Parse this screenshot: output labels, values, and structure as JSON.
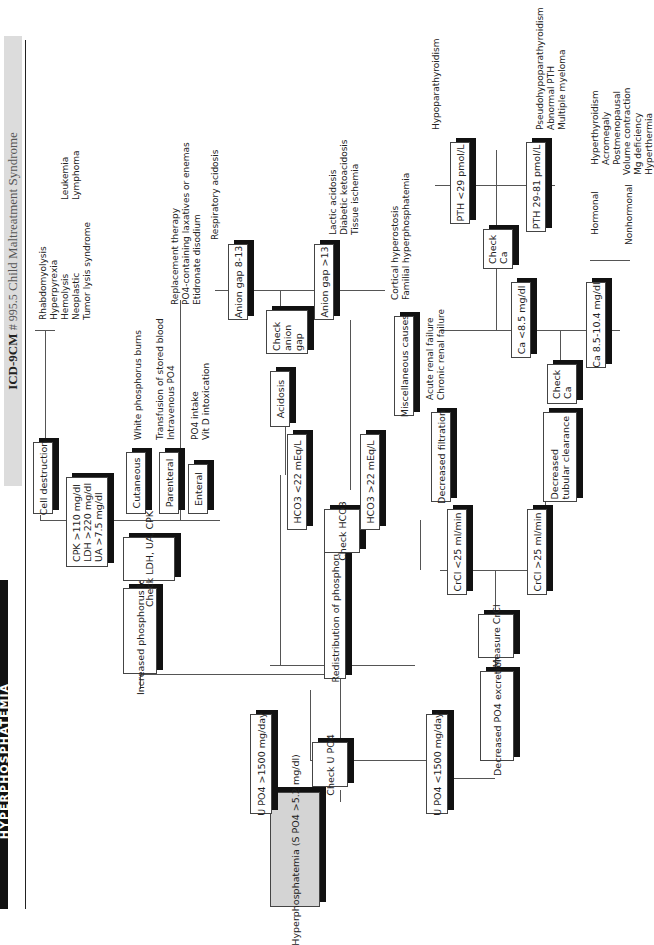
{
  "header": {
    "code_label": "ICD-9CM",
    "code": "# 995.5",
    "title": "Child Maltreatment Syndrome"
  },
  "page_title": "HYPERPHOSPHATEMIA",
  "root": {
    "label": "Hyperphosphatemia (S PO4 >5.2 mg/dl)"
  },
  "check_upo4": {
    "label": "Check U PO4"
  },
  "branches": {
    "upo4_high": "U PO4 >1500 mg/day",
    "upo4_low": "U PO4 <1500 mg/day",
    "increased_load": "Increased phosphorus load",
    "redistribution": "Redistribution of phosphorus",
    "decreased_excretion": "Decreased PO4 excretion"
  },
  "load": {
    "check": "Check LDH, UA, CPK",
    "thresholds": "CPK >110 mg/dl  LDH >220 mg/dl  UA >7.5 mg/dl",
    "cell_destruction": "Cell destruction",
    "cell_causes": [
      "Rhabdomyolysis",
      "Hyperpyrexia",
      "Hemolysis",
      "Neoplastic",
      "Tumor lysis syndrome"
    ],
    "neoplastic_causes": [
      "Leukemia",
      "Lymphoma"
    ],
    "cutaneous": "Cutaneous",
    "cutaneous_causes": [
      "White phosphorus burns"
    ],
    "parenteral": "Parenteral",
    "parenteral_causes": [
      "Transfusion of stored blood",
      "Intravenous PO4"
    ],
    "enteral": "Enteral",
    "enteral_causes": [
      "PO4 intake",
      "Vit D intoxication"
    ],
    "intake_causes": [
      "Replacement therapy",
      "PO4-containing laxatives or enemas",
      "Etidronate disodium"
    ]
  },
  "redistribution": {
    "check": "Check HCO3",
    "low": "HCO3 <22 mEq/L",
    "high": "HCO3 >22 mEq/L",
    "acidosis": "Acidosis",
    "check_anion": "Check anion gap",
    "ag_normal": "Anion gap 8-13",
    "ag_normal_causes": [
      "Respiratory acidosis"
    ],
    "ag_high": "Anion gap >13",
    "ag_high_causes": [
      "Lactic acidosis",
      "Diabetic ketoacidosis",
      "Tissue ischemia"
    ],
    "misc": "Miscellaneous causes",
    "misc_causes": [
      "Cortical hyperostosis",
      "Familial hyperphosphatemia"
    ]
  },
  "excretion": {
    "measure": "Measure CrCl",
    "crcl_low": "CrCl <25 ml/min",
    "crcl_high": "CrCl >25 ml/min",
    "dec_filtration": "Decreased filtration",
    "filtration_causes": [
      "Acute renal failure",
      "Chronic renal failure"
    ],
    "dec_tubular": "Decreased tubular clearance",
    "check_ca": "Check Ca",
    "ca_low": "Ca <8.5 mg/dl",
    "ca_normal": "Ca 8.5-10.4 mg/dl",
    "check_ca2": "Check Ca",
    "pth_low": "PTH <29 pmol/L",
    "pth_low_causes": [
      "Hypoparathyroidism"
    ],
    "pth_mid": "PTH 29-81 pmol/L",
    "pth_mid_causes": [
      "Pseudohypoparathyroidism",
      "Abnormal PTH",
      "Multiple myeloma"
    ],
    "hormonal": "Hormonal",
    "hormonal_causes": [
      "Hyperthyroidism",
      "Acromegaly",
      "Postmenopausal"
    ],
    "nonhormonal": "Nonhormonal",
    "nonhormonal_causes": [
      "Volume contraction",
      "Mg deficiency",
      "Hyperthermia"
    ]
  }
}
